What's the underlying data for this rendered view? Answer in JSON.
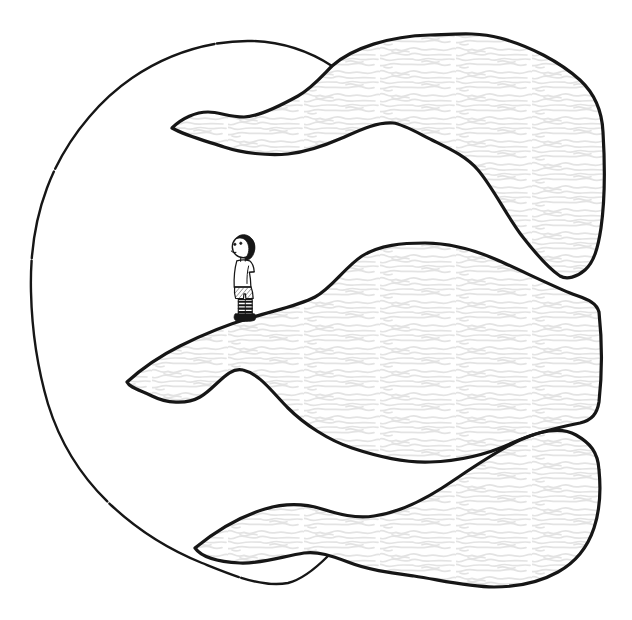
{
  "scene": {
    "description": "Hand-drawn black ink illustration on white paper: a large open rounded outline (like a giant letter C) encloses three wavy, scribble-textured gusts that flow out toward the right edge of the picture; a tiny boy with dark hair, a white shirt, hatched shorts and striped socks stands facing left on the crest of the middle gust.",
    "parts": {
      "outer_outline": "large open rounded ink outline",
      "top_wave": "upper flowing gust with scribble texture",
      "middle_wave": "middle flowing gust that the boy stands on",
      "bottom_wave": "lower flowing gust with scribble texture",
      "boy": "small boy standing and facing left"
    }
  },
  "colors": {
    "background": "#ffffff",
    "ink": "#161616",
    "texture": "#e3e3e3",
    "hatch": "#454545"
  }
}
